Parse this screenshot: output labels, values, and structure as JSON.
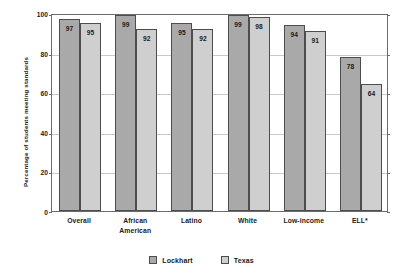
{
  "chart_data": {
    "type": "bar",
    "title": "",
    "subtitle": "",
    "xlabel": "",
    "ylabel": "Percentage of students meeting standards",
    "ylim": [
      0,
      100
    ],
    "yticks": [
      0,
      20,
      40,
      60,
      80,
      100
    ],
    "ytick_labels": [
      "0",
      "20",
      "40",
      "60",
      "80",
      "100"
    ],
    "grid": true,
    "grid_axis": "y",
    "legend_position": "bottom-center",
    "categories": [
      "Overall",
      "African American",
      "Latino",
      "White",
      "Low-income",
      "ELL*"
    ],
    "category_lines": [
      [
        "Overall"
      ],
      [
        "African",
        "American"
      ],
      [
        "Latino"
      ],
      [
        "White"
      ],
      [
        "Low-income"
      ],
      [
        "ELL*"
      ]
    ],
    "series": [
      {
        "name": "Lockhart",
        "color": "#a9a9a9",
        "values": [
          97,
          99,
          95,
          99,
          94,
          78
        ],
        "labels": [
          "97",
          "99",
          "95",
          "99",
          "94",
          "78"
        ]
      },
      {
        "name": "Texas",
        "color": "#cfcfcf",
        "values": [
          95,
          92,
          92,
          98,
          91,
          64
        ],
        "labels": [
          "95",
          "92",
          "92",
          "98",
          "91",
          "64"
        ]
      }
    ],
    "annotations": []
  },
  "colors": {
    "series_lockhart": "#a9a9a9",
    "series_texas": "#cfcfcf",
    "bar_outline": "#4d4d4d",
    "axis_line": "#6b6b6b",
    "gridline": "#c9c9c9",
    "text": "#1a1a1a",
    "background": "#ffffff"
  }
}
